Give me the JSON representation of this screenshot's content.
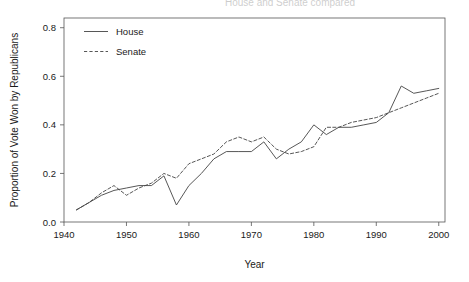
{
  "figure": {
    "title": "House and Senate compared",
    "title_clipped": true
  },
  "chart_data": {
    "type": "line",
    "title": "House and Senate compared",
    "xlabel": "Year",
    "ylabel": "Proportion of Vote Won by Republicans",
    "xlim": [
      1940,
      2001
    ],
    "ylim": [
      0.0,
      0.84
    ],
    "grid": false,
    "legend_position": "top-left-inside",
    "xticks": [
      1940,
      1950,
      1960,
      1970,
      1980,
      1990,
      2000
    ],
    "xtick_labels": [
      "1940",
      "1950",
      "1960",
      "1970",
      "1980",
      "1990",
      "2000"
    ],
    "yticks": [
      0.0,
      0.2,
      0.4,
      0.6,
      0.8
    ],
    "ytick_labels": [
      "0.0",
      "0.2",
      "0.4",
      "0.6",
      "0.8"
    ],
    "x": [
      1942,
      1944,
      1946,
      1948,
      1950,
      1952,
      1954,
      1956,
      1958,
      1960,
      1962,
      1964,
      1966,
      1968,
      1970,
      1972,
      1974,
      1976,
      1978,
      1980,
      1982,
      1984,
      1986,
      1988,
      1990,
      1992,
      1994,
      1996,
      1998,
      2000
    ],
    "series": [
      {
        "name": "House",
        "style": "solid",
        "color": "#444444",
        "values": [
          0.05,
          0.08,
          0.11,
          0.13,
          0.14,
          0.15,
          0.15,
          0.19,
          0.07,
          0.15,
          0.2,
          0.26,
          0.29,
          0.29,
          0.29,
          0.33,
          0.26,
          0.3,
          0.33,
          0.4,
          0.36,
          0.39,
          0.39,
          0.4,
          0.41,
          0.45,
          0.56,
          0.53,
          0.54,
          0.55
        ]
      },
      {
        "name": "Senate",
        "style": "dashed",
        "color": "#444444",
        "values": [
          0.05,
          0.08,
          0.12,
          0.15,
          0.11,
          0.14,
          0.16,
          0.2,
          0.18,
          0.24,
          0.26,
          0.28,
          0.33,
          0.35,
          0.33,
          0.35,
          0.3,
          0.28,
          0.29,
          0.31,
          0.39,
          0.39,
          0.41,
          0.42,
          0.43,
          0.45,
          0.47,
          0.49,
          0.51,
          0.53
        ]
      }
    ]
  },
  "legend": {
    "items": [
      {
        "label": "House",
        "style": "solid"
      },
      {
        "label": "Senate",
        "style": "dashed"
      }
    ]
  }
}
